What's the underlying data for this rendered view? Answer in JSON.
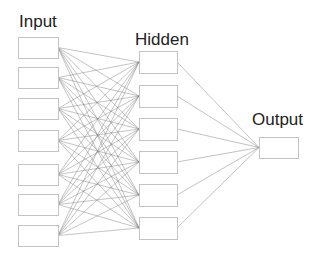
{
  "diagram": {
    "type": "neural-network",
    "layers": [
      {
        "name": "Input",
        "label": "Input",
        "node_count": 7,
        "label_pos": [
          19,
          13
        ],
        "box": {
          "x": 18,
          "w": 40,
          "h": 21
        },
        "node_tops": [
          37,
          67,
          98,
          130,
          164,
          194,
          225
        ]
      },
      {
        "name": "Hidden",
        "label": "Hidden",
        "node_count": 6,
        "label_pos": [
          135,
          31
        ],
        "box": {
          "x": 139,
          "w": 38,
          "h": 22
        },
        "node_tops": [
          51,
          85,
          118,
          151,
          184,
          217
        ]
      },
      {
        "name": "Output",
        "label": "Output",
        "node_count": 1,
        "label_pos": [
          252,
          111
        ],
        "box": {
          "x": 259,
          "w": 39,
          "h": 21
        },
        "node_tops": [
          137
        ]
      }
    ],
    "connections": [
      {
        "from": "Input",
        "to": "Hidden",
        "type": "fully-connected"
      },
      {
        "from": "Hidden",
        "to": "Output",
        "type": "fully-connected"
      }
    ],
    "colors": {
      "node_border": "#c4c4c4",
      "edge": "#7a7a7a",
      "label": "#222222",
      "background": "#ffffff"
    }
  }
}
